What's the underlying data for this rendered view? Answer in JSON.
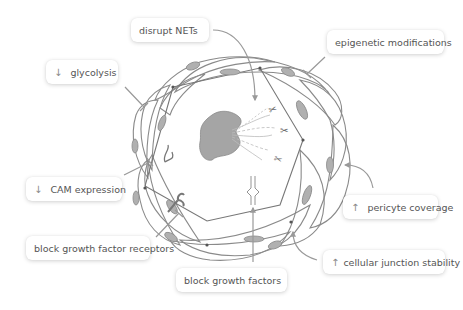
{
  "diagram": {
    "labels": {
      "disrupt_nets": {
        "text": "disrupt NETs",
        "indicator": ""
      },
      "glycolysis": {
        "text": "glycolysis",
        "indicator": "↓"
      },
      "epigenetic": {
        "text": "epigenetic modifications",
        "indicator": ""
      },
      "cam_expression": {
        "text": "CAM expression",
        "indicator": "↓"
      },
      "block_receptors": {
        "text": "block growth factor receptors",
        "indicator": ""
      },
      "block_factors": {
        "text": "block growth factors",
        "indicator": ""
      },
      "pericyte": {
        "text": "pericyte coverage",
        "indicator": "↑"
      },
      "junction": {
        "text": "cellular junction stability",
        "indicator": "↑"
      }
    },
    "colors": {
      "line": "#8a8a8a",
      "nucleus_fill": "#a8a8a8",
      "neutrophil_fill": "#a0a0a0",
      "text": "#555555",
      "background": "#ffffff"
    }
  }
}
